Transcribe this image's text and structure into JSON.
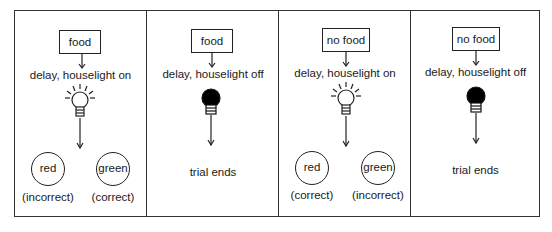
{
  "panels": [
    {
      "stimulus": "food",
      "delay": "delay, houselight on",
      "houselight": "on",
      "outcome_type": "choice",
      "choices": [
        {
          "key": "red",
          "result": "(incorrect)"
        },
        {
          "key": "green",
          "result": "(correct)"
        }
      ]
    },
    {
      "stimulus": "food",
      "delay": "delay, houselight off",
      "houselight": "off",
      "outcome_type": "end",
      "end_text": "trial ends"
    },
    {
      "stimulus": "no food",
      "delay": "delay, houselight on",
      "houselight": "on",
      "outcome_type": "choice",
      "choices": [
        {
          "key": "red",
          "result": "(correct)"
        },
        {
          "key": "green",
          "result": "(incorrect)"
        }
      ]
    },
    {
      "stimulus": "no food",
      "delay": "delay, houselight off",
      "houselight": "off",
      "outcome_type": "end",
      "end_text": "trial ends"
    }
  ]
}
